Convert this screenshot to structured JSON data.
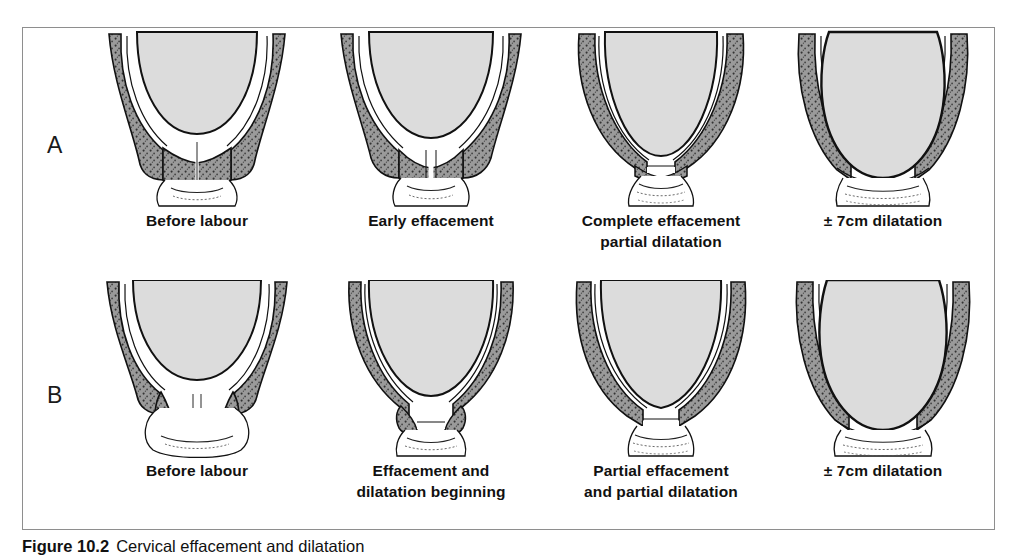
{
  "figure": {
    "caption_number": "Figure 10.2",
    "caption_text": "Cervical effacement and dilatation",
    "border_color": "#8e8e8e"
  },
  "colors": {
    "cervix_stipple_gray": "#8a8a8a",
    "fetal_head_gray": "#d9d9d9",
    "outline_black": "#111111",
    "background_white": "#ffffff"
  },
  "rows": [
    {
      "letter": "A",
      "panels": [
        {
          "caption_lines": [
            "Before labour"
          ]
        },
        {
          "caption_lines": [
            "Early effacement"
          ]
        },
        {
          "caption_lines": [
            "Complete effacement",
            "partial dilatation"
          ]
        },
        {
          "caption_lines": [
            "± 7cm dilatation"
          ]
        }
      ]
    },
    {
      "letter": "B",
      "panels": [
        {
          "caption_lines": [
            "Before labour"
          ]
        },
        {
          "caption_lines": [
            "Effacement and",
            "dilatation beginning"
          ]
        },
        {
          "caption_lines": [
            "Partial effacement",
            "and partial dilatation"
          ]
        },
        {
          "caption_lines": [
            "± 7cm dilatation"
          ]
        }
      ]
    }
  ]
}
